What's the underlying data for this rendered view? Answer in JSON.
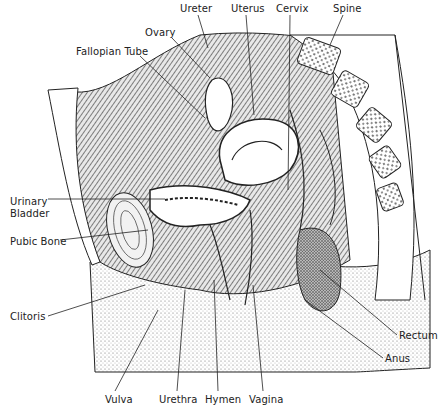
{
  "diagram": {
    "labels": [
      {
        "id": "ureter",
        "text": "Ureter",
        "x": 180,
        "y": 3
      },
      {
        "id": "uterus",
        "text": "Uterus",
        "x": 231,
        "y": 3
      },
      {
        "id": "cervix",
        "text": "Cervix",
        "x": 276,
        "y": 3
      },
      {
        "id": "spine",
        "text": "Spine",
        "x": 333,
        "y": 3
      },
      {
        "id": "ovary",
        "text": "Ovary",
        "x": 145,
        "y": 27
      },
      {
        "id": "fallopian-tube",
        "text": "Fallopian Tube",
        "x": 76,
        "y": 46
      },
      {
        "id": "urinary-bladder-1",
        "text": "Urinary",
        "x": 10,
        "y": 196
      },
      {
        "id": "urinary-bladder-2",
        "text": "Bladder",
        "x": 10,
        "y": 208
      },
      {
        "id": "pubic-bone",
        "text": "Pubic Bone",
        "x": 10,
        "y": 236
      },
      {
        "id": "clitoris",
        "text": "Clitoris",
        "x": 10,
        "y": 311
      },
      {
        "id": "rectum",
        "text": "Rectum",
        "x": 399,
        "y": 330
      },
      {
        "id": "anus",
        "text": "Anus",
        "x": 385,
        "y": 353
      },
      {
        "id": "vulva",
        "text": "Vulva",
        "x": 105,
        "y": 394
      },
      {
        "id": "urethra",
        "text": "Urethra",
        "x": 159,
        "y": 394
      },
      {
        "id": "hymen",
        "text": "Hymen",
        "x": 205,
        "y": 394
      },
      {
        "id": "vagina",
        "text": "Vagina",
        "x": 249,
        "y": 394
      }
    ]
  }
}
